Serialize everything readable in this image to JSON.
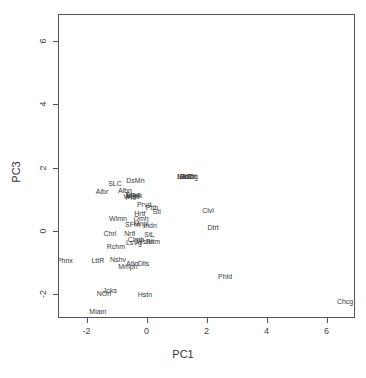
{
  "chart_data": {
    "type": "scatter",
    "title": "",
    "xlabel": "PC1",
    "ylabel": "PC3",
    "xlim": [
      -2.95,
      6.95
    ],
    "ylim": [
      -2.75,
      6.85
    ],
    "xticks": [
      -2,
      0,
      2,
      4,
      6
    ],
    "yticks": [
      -2,
      0,
      2,
      4,
      6
    ],
    "xtick_labels": [
      "-2",
      "0",
      "2",
      "4",
      "6"
    ],
    "ytick_labels": [
      "-2",
      "0",
      "2",
      "4",
      "6"
    ],
    "grid": false,
    "legend": "none",
    "marker": "text-label",
    "label_color": "#3a3a3a",
    "frame_color": "#555555",
    "points": [
      {
        "label": "SLC",
        "x": -1.05,
        "y": 1.53
      },
      {
        "label": "DsMn",
        "x": -0.37,
        "y": 1.62
      },
      {
        "label": "Albr",
        "x": -1.48,
        "y": 1.25
      },
      {
        "label": "Albn",
        "x": -0.72,
        "y": 1.3
      },
      {
        "label": "Dnvr",
        "x": -0.45,
        "y": 1.18
      },
      {
        "label": "Wcht",
        "x": -0.5,
        "y": 1.1
      },
      {
        "label": "Mlwk",
        "x": -0.4,
        "y": 1.14
      },
      {
        "label": "Prtl",
        "x": -0.52,
        "y": 1.06
      },
      {
        "label": "Prvd",
        "x": -0.08,
        "y": 0.85
      },
      {
        "label": "Pttb",
        "x": 0.18,
        "y": 0.76
      },
      {
        "label": "Hrtf",
        "x": -0.22,
        "y": 0.56
      },
      {
        "label": "Stl",
        "x": 0.34,
        "y": 0.62
      },
      {
        "label": "Wlmn",
        "x": -0.95,
        "y": 0.42
      },
      {
        "label": "Omh",
        "x": -0.18,
        "y": 0.4
      },
      {
        "label": "SFrn",
        "x": -0.46,
        "y": 0.22
      },
      {
        "label": "Mnpl",
        "x": -0.18,
        "y": 0.24
      },
      {
        "label": "Indn",
        "x": 0.12,
        "y": 0.2
      },
      {
        "label": "Chrl",
        "x": -1.22,
        "y": -0.06
      },
      {
        "label": "Nrfl",
        "x": -0.56,
        "y": -0.05
      },
      {
        "label": "StL",
        "x": 0.1,
        "y": -0.1
      },
      {
        "label": "Clmb",
        "x": -0.35,
        "y": -0.26
      },
      {
        "label": "LsVg",
        "x": -0.42,
        "y": -0.34
      },
      {
        "label": "Wshn",
        "x": -0.05,
        "y": -0.32
      },
      {
        "label": "Bltm",
        "x": 0.22,
        "y": -0.32
      },
      {
        "label": "Rchm",
        "x": -1.02,
        "y": -0.48
      },
      {
        "label": "Phnx",
        "x": -2.72,
        "y": -0.92
      },
      {
        "label": "LttR",
        "x": -1.62,
        "y": -0.92
      },
      {
        "label": "Nshv",
        "x": -0.95,
        "y": -0.9
      },
      {
        "label": "Mmph",
        "x": -0.62,
        "y": -1.12
      },
      {
        "label": "Atln",
        "x": -0.48,
        "y": -1.02
      },
      {
        "label": "Dlls",
        "x": -0.1,
        "y": -1.0
      },
      {
        "label": "Clvl",
        "x": 2.05,
        "y": 0.66
      },
      {
        "label": "Dtrt",
        "x": 2.22,
        "y": 0.12
      },
      {
        "label": "Phld",
        "x": 2.62,
        "y": -1.42
      },
      {
        "label": "NOrl",
        "x": -1.42,
        "y": -1.95
      },
      {
        "label": "Jcks",
        "x": -1.22,
        "y": -1.88
      },
      {
        "label": "Hstn",
        "x": -0.05,
        "y": -1.98
      },
      {
        "label": "Miam",
        "x": -1.62,
        "y": -2.52
      },
      {
        "label": "Chcg",
        "x": 6.62,
        "y": -2.2
      },
      {
        "label": "LA",
        "x": 1.18,
        "y": 1.74
      },
      {
        "label": "NYC",
        "x": 1.26,
        "y": 1.74
      },
      {
        "label": "Bstn",
        "x": 1.34,
        "y": 1.74
      },
      {
        "label": "SnDg",
        "x": 1.42,
        "y": 1.74
      },
      {
        "label": "Sttl",
        "x": 1.5,
        "y": 1.74
      }
    ]
  }
}
